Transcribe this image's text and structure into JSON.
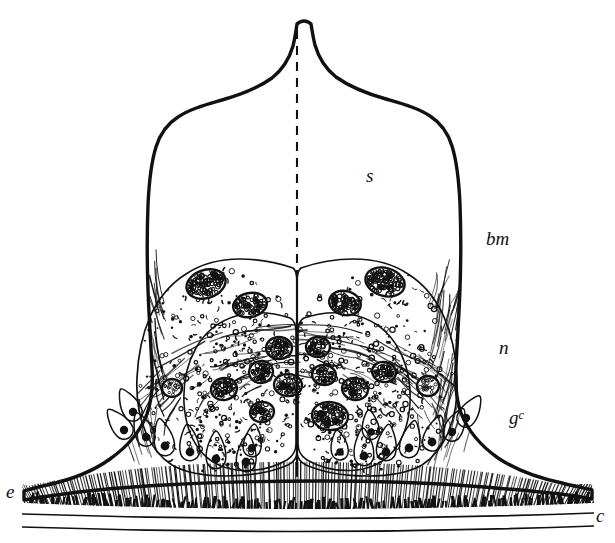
{
  "figure": {
    "kind": "histological-section-illustration",
    "background_color": "#ffffff",
    "ink_color": "#111111",
    "width": 615,
    "height": 543
  },
  "labels": [
    {
      "id": "s",
      "text": "s",
      "sup": "",
      "x": 366,
      "y": 166,
      "size": 19,
      "style": "italic",
      "name": "label-s",
      "meaning": "sensory cone / secreted cap"
    },
    {
      "id": "bm",
      "text": "bm",
      "sup": "",
      "x": 486,
      "y": 229,
      "size": 19,
      "style": "italic",
      "name": "label-bm",
      "meaning": "basement membrane"
    },
    {
      "id": "n",
      "text": "n",
      "sup": "",
      "x": 499,
      "y": 338,
      "size": 19,
      "style": "italic",
      "name": "label-n",
      "meaning": "nerve"
    },
    {
      "id": "gc",
      "text": "g",
      "sup": "c",
      "x": 509,
      "y": 408,
      "size": 19,
      "style": "italic",
      "name": "label-gc",
      "meaning": "gland cell"
    },
    {
      "id": "e",
      "text": "e",
      "sup": "",
      "x": 6,
      "y": 482,
      "size": 19,
      "style": "italic",
      "name": "label-e",
      "meaning": "epithelium"
    },
    {
      "id": "c",
      "text": "c",
      "sup": "",
      "x": 596,
      "y": 506,
      "size": 19,
      "style": "italic",
      "name": "label-c",
      "meaning": "cuticle"
    }
  ],
  "geometry": {
    "apex": {
      "x": 297,
      "y": 24
    },
    "midline_x": 297,
    "dashed_midline": {
      "x": 297,
      "y_top": 30,
      "y_bottom": 272,
      "dash": "9 7",
      "width": 2.1
    },
    "outline_path": "M 297 24 C 296 31 295 38 293 46 C 289 60 282 70 272 78 C 258 88 240 95 222 100 C 205 105 190 109 178 117 C 167 124 160 134 156 147 C 151 163 149 183 148 205 C 147 232 147 262 148 290 C 149 318 151 345 152 368 C 153 385 152 400 147 414 C 140 432 127 447 110 459 C 92 472 70 480 47 485 C 38 487 30 489 24 491 L 24 500 C 34 498 48 496 64 494 C 92 490 126 487 165 485 C 215 482 272 481 320 481 C 375 481 430 483 470 486 C 510 489 545 492 568 495 C 578 496 586 498 592 499 L 592 490 C 584 488 574 486 562 483 C 538 478 516 470 498 458 C 481 446 468 431 461 413 C 456 399 455 384 456 367 C 457 344 459 317 460 289 C 461 261 461 231 460 204 C 459 182 457 162 452 146 C 448 133 441 123 430 116 C 418 108 403 104 386 99 C 368 94 350 87 336 77 C 326 69 319 59 315 45 C 313 37 312 30 311 24 C 307 20 301 20 297 24 Z",
    "lobe_left_path": "M 293 268 C 276 262 258 259 240 259 C 220 259 201 264 186 274 C 170 284 158 299 150 317 C 142 335 138 356 137 378 C 136 398 139 417 146 433 C 152 447 161 458 172 465 C 186 473 205 476 226 476 C 250 476 272 472 288 465 C 294 462 297 458 297 452 L 297 282 C 297 275 296 270 293 268 Z",
    "lobe_right_path": "M 301 268 C 318 262 336 259 354 259 C 374 259 393 264 408 274 C 424 284 436 299 444 317 C 452 335 456 356 457 378 C 458 398 455 417 448 433 C 442 447 433 458 422 465 C 408 473 389 476 368 476 C 344 476 322 472 306 465 C 300 462 297 458 297 452 L 297 282 C 297 275 298 270 301 268 Z",
    "inner_core_left_path": "M 290 318 C 272 312 253 311 236 316 C 219 321 205 332 196 348 C 187 364 183 383 184 403 C 185 421 190 437 199 449 C 208 461 221 468 237 470 C 255 472 273 468 287 460 C 293 456 296 451 296 444 L 296 332 C 296 324 294 320 290 318 Z",
    "inner_core_right_path": "M 304 318 C 322 312 341 311 358 316 C 375 321 389 332 398 348 C 407 364 411 383 410 403 C 409 421 404 437 395 449 C 386 461 373 468 357 470 C 339 472 321 468 307 460 C 301 456 298 451 298 444 L 298 332 C 298 324 300 320 304 318 Z",
    "central_cleft_path": "M 297 272 L 297 476",
    "base_epithelium": {
      "top_y_center": 481,
      "bottom_y_center": 503,
      "left_x": 22,
      "right_x": 594
    },
    "cuticle_lines": [
      {
        "name": "cuticle-line-upper",
        "x1": 22,
        "y1": 514,
        "x2": 594,
        "y2": 513,
        "sag": 5,
        "width": 1.7
      },
      {
        "name": "cuticle-line-lower",
        "x1": 22,
        "y1": 527,
        "x2": 594,
        "y2": 526,
        "sag": 5,
        "width": 1.7
      }
    ]
  },
  "texture": {
    "stipple_seed": 20231,
    "granule_count": 520,
    "granule_radius": [
      1.1,
      2.6
    ],
    "fiber_count_outer": 130,
    "hatch_count_base": 210,
    "hatch_dark_band_count": 150
  },
  "nuclei": {
    "note": "large outlined oval cells with coarse stippled chromatin",
    "radius_x": [
      9,
      18
    ],
    "radius_y": [
      8,
      15
    ],
    "items": [
      {
        "name": "nucleus-cell",
        "x": 206,
        "y": 284,
        "rx": 20,
        "ry": 14,
        "rot": -18,
        "fill": "coarse"
      },
      {
        "name": "nucleus-cell",
        "x": 250,
        "y": 305,
        "rx": 17,
        "ry": 12,
        "rot": -12,
        "fill": "coarse"
      },
      {
        "name": "nucleus-cell",
        "x": 345,
        "y": 303,
        "rx": 16,
        "ry": 12,
        "rot": 14,
        "fill": "coarse"
      },
      {
        "name": "nucleus-cell",
        "x": 385,
        "y": 282,
        "rx": 20,
        "ry": 14,
        "rot": 16,
        "fill": "coarse"
      },
      {
        "name": "nucleus-cell",
        "x": 279,
        "y": 348,
        "rx": 13,
        "ry": 11,
        "rot": 0,
        "fill": "coarse"
      },
      {
        "name": "nucleus-cell",
        "x": 318,
        "y": 347,
        "rx": 12,
        "ry": 10,
        "rot": 0,
        "fill": "coarse"
      },
      {
        "name": "nucleus-cell",
        "x": 261,
        "y": 372,
        "rx": 12,
        "ry": 11,
        "rot": -8,
        "fill": "coarse"
      },
      {
        "name": "nucleus-cell",
        "x": 324,
        "y": 375,
        "rx": 12,
        "ry": 10,
        "rot": 8,
        "fill": "coarse"
      },
      {
        "name": "nucleus-cell",
        "x": 288,
        "y": 385,
        "rx": 14,
        "ry": 11,
        "rot": 4,
        "fill": "coarse"
      },
      {
        "name": "nucleus-cell",
        "x": 224,
        "y": 389,
        "rx": 13,
        "ry": 11,
        "rot": -10,
        "fill": "coarse"
      },
      {
        "name": "nucleus-cell",
        "x": 355,
        "y": 389,
        "rx": 13,
        "ry": 11,
        "rot": 10,
        "fill": "coarse"
      },
      {
        "name": "nucleus-cell",
        "x": 384,
        "y": 372,
        "rx": 12,
        "ry": 10,
        "rot": 12,
        "fill": "coarse"
      },
      {
        "name": "nucleus-cell",
        "x": 262,
        "y": 412,
        "rx": 12,
        "ry": 10,
        "rot": -6,
        "fill": "coarse"
      },
      {
        "name": "nucleus-cell",
        "x": 330,
        "y": 416,
        "rx": 18,
        "ry": 14,
        "rot": 6,
        "fill": "coarse"
      },
      {
        "name": "nucleus-cell",
        "x": 428,
        "y": 386,
        "rx": 11,
        "ry": 10,
        "rot": 0,
        "fill": "fine"
      },
      {
        "name": "nucleus-cell",
        "x": 172,
        "y": 388,
        "rx": 10,
        "ry": 9,
        "rot": 0,
        "fill": "fine"
      }
    ]
  },
  "gland_cells": {
    "note": "flask-shaped gland cells with dark round nucleus, necks radiating toward base",
    "items": [
      {
        "name": "gland-cell",
        "x": 133,
        "y": 412,
        "angle": -118,
        "len": 26,
        "r": 4.2
      },
      {
        "name": "gland-cell",
        "x": 124,
        "y": 430,
        "angle": -128,
        "len": 26,
        "r": 4.2
      },
      {
        "name": "gland-cell",
        "x": 146,
        "y": 437,
        "angle": -112,
        "len": 26,
        "r": 4.2
      },
      {
        "name": "gland-cell",
        "x": 165,
        "y": 446,
        "angle": -102,
        "len": 28,
        "r": 4.4
      },
      {
        "name": "gland-cell",
        "x": 190,
        "y": 452,
        "angle": -96,
        "len": 28,
        "r": 4.4
      },
      {
        "name": "gland-cell",
        "x": 216,
        "y": 459,
        "angle": -90,
        "len": 28,
        "r": 4.4
      },
      {
        "name": "gland-cell",
        "x": 246,
        "y": 462,
        "angle": -86,
        "len": 28,
        "r": 4.4
      },
      {
        "name": "gland-cell",
        "x": 252,
        "y": 448,
        "angle": -84,
        "len": 24,
        "r": 4.0
      },
      {
        "name": "gland-cell",
        "x": 364,
        "y": 456,
        "angle": -92,
        "len": 28,
        "r": 4.4
      },
      {
        "name": "gland-cell",
        "x": 386,
        "y": 452,
        "angle": -84,
        "len": 28,
        "r": 4.4
      },
      {
        "name": "gland-cell",
        "x": 409,
        "y": 448,
        "angle": -78,
        "len": 28,
        "r": 4.4
      },
      {
        "name": "gland-cell",
        "x": 432,
        "y": 442,
        "angle": -72,
        "len": 28,
        "r": 4.4
      },
      {
        "name": "gland-cell",
        "x": 452,
        "y": 432,
        "angle": -64,
        "len": 26,
        "r": 4.2
      },
      {
        "name": "gland-cell",
        "x": 466,
        "y": 418,
        "angle": -58,
        "len": 26,
        "r": 4.2
      },
      {
        "name": "gland-cell",
        "x": 371,
        "y": 432,
        "angle": -96,
        "len": 22,
        "r": 3.8
      },
      {
        "name": "gland-cell",
        "x": 340,
        "y": 452,
        "angle": -98,
        "len": 22,
        "r": 3.8
      }
    ]
  }
}
